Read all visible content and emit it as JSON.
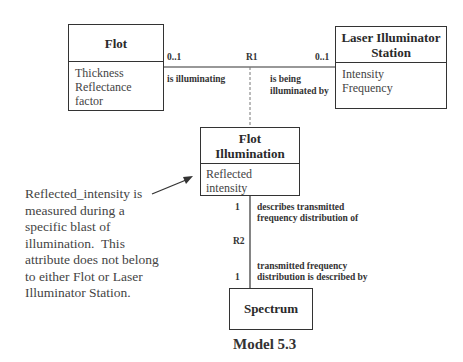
{
  "diagram": {
    "caption": "Model 5.3",
    "classes": {
      "flot": {
        "name": "Flot",
        "attributes": [
          "Thickness",
          "Reflectance factor"
        ]
      },
      "laser": {
        "name_line1": "Laser Illuminator",
        "name_line2": "Station",
        "attributes": [
          "Intensity",
          "Frequency"
        ]
      },
      "flot_illumination": {
        "name_line1": "Flot",
        "name_line2": "Illumination",
        "attributes": [
          "Reflected intensity"
        ]
      },
      "spectrum": {
        "name": "Spectrum"
      }
    },
    "relationships": {
      "r1": {
        "id": "R1",
        "left_multiplicity": "0..1",
        "right_multiplicity": "0..1",
        "left_phrase": "is illuminating",
        "right_phrase_line1": "is being",
        "right_phrase_line2": "illuminated by"
      },
      "r2": {
        "id": "R2",
        "top_multiplicity": "1",
        "bottom_multiplicity": "1",
        "top_phrase_line1": "describes transmitted",
        "top_phrase_line2": "frequency distribution of",
        "bottom_phrase_line1": "transmitted frequency",
        "bottom_phrase_line2": "distribution is described by"
      }
    },
    "note": {
      "lines": [
        "Reflected_intensity is",
        "measured during a",
        "specific blast of",
        "illumination.  This",
        "attribute does not belong",
        "to either Flot or Laser",
        "Illuminator Station."
      ]
    }
  }
}
